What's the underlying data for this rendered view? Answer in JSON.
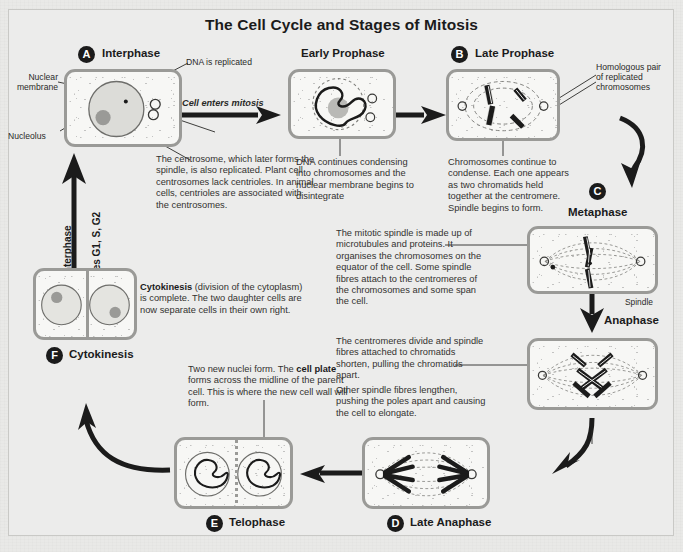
{
  "title": "The Cell Cycle and Stages of Mitosis",
  "theme": {
    "page_bg": "#e9e9e7",
    "panel_bg": "#ececeb",
    "cell_border": "#9a9a97",
    "cell_fill": "#f7f7f5",
    "ink": "#1b1b1b",
    "body_text": "#333230"
  },
  "stages": [
    {
      "id": "A",
      "letter": "A",
      "name": "Interphase"
    },
    {
      "id": "early_prophase",
      "letter": "",
      "name": "Early Prophase"
    },
    {
      "id": "B",
      "letter": "B",
      "name": "Late Prophase"
    },
    {
      "id": "C",
      "letter": "C",
      "name": "Metaphase"
    },
    {
      "id": "anaphase",
      "letter": "",
      "name": "Anaphase"
    },
    {
      "id": "D",
      "letter": "D",
      "name": "Late Anaphase"
    },
    {
      "id": "E",
      "letter": "E",
      "name": "Telophase"
    },
    {
      "id": "F",
      "letter": "F",
      "name": "Cytokinesis"
    }
  ],
  "labels": {
    "nuclear_membrane": "Nuclear\nmembrane",
    "nucleolus": "Nucleolus",
    "dna_replicated": "DNA is replicated",
    "cell_enters_mitosis": "Cell enters mitosis",
    "homologous_pair": "Homologous pair\nof replicated\nchromosomes",
    "spindle": "Spindle",
    "interphase_axis": "Interphase",
    "stages_axis": "Stages G1, S, G2"
  },
  "notes": {
    "centrosome": "The centrosome, which later forms the spindle, is also replicated. Plant cell centrosomes lack centrioles. In animal cells, centrioles are associated with the centrosomes.",
    "early_prophase": "DNA continues condensing into chromosomes and the nuclear membrane begins to disintegrate",
    "late_prophase": "Chromosomes continue to condense. Each one appears as two chromatids held together at the centromere. Spindle begins to form.",
    "metaphase": "The mitotic spindle is made up of microtubules and proteins. It organises the chromosomes on the equator of the cell. Some spindle fibres attach to the centromeres of the chromosomes and some span the cell.",
    "anaphase_1": "The centromeres divide and spindle fibres attached to chromatids shorten, pulling the chromatids apart.",
    "anaphase_2": "Other spindle fibres lengthen, pushing the poles apart and causing the cell to elongate.",
    "cytokinesis_lead": "Cytokinesis",
    "cytokinesis_rest": " (division of the cytoplasm) is complete. The two daughter cells are now separate cells in their own right.",
    "telophase_a": "Two new nuclei form. The ",
    "telophase_b": "cell plate",
    "telophase_c": " forms across the midline of the parent cell. This is where the new cell wall will form."
  }
}
